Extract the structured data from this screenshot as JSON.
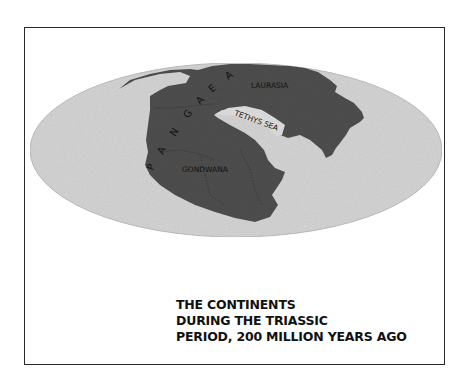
{
  "map": {
    "supercontinent_label": "PANGAEA",
    "supercontinent_letters": [
      "P",
      "A",
      "N",
      "G",
      "A",
      "E",
      "A"
    ],
    "regions": {
      "north": "LAURASIA",
      "south": "GONDWANA",
      "sea": "TETHYS SEA"
    },
    "colors": {
      "ocean": "#d4d4d4",
      "land": "#4e4e4e",
      "frame": "#2a2a2a"
    }
  },
  "caption": {
    "lines": [
      "THE CONTINENTS",
      "DURING THE TRIASSIC",
      "PERIOD, 200 MILLION YEARS AGO"
    ]
  }
}
